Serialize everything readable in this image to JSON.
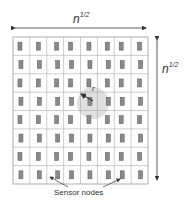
{
  "diagram": {
    "top_label": {
      "base": "n",
      "exponent": "1/2"
    },
    "right_label": {
      "base": "n",
      "exponent": "1/2"
    },
    "radius_label": "r",
    "caption": "Sensor nodes",
    "grid": {
      "rows": 8,
      "cols": 8
    },
    "colors": {
      "grid": "#9a9a9a",
      "node_fill": "#8a8a8a",
      "node_stroke": "#555555",
      "circle": "#d6d6d6",
      "text": "#333333"
    }
  }
}
